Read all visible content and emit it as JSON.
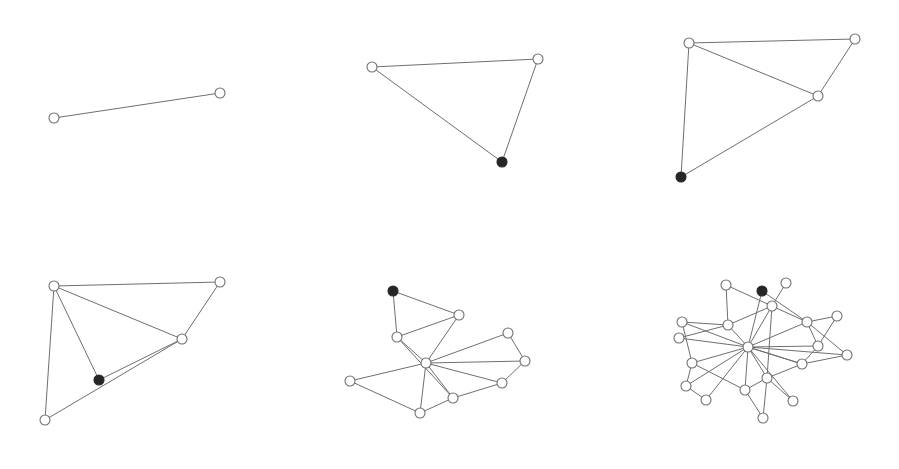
{
  "figure": {
    "node_radius": 5,
    "colors": {
      "edge": "#6f6f6f",
      "open_node_stroke": "#707070",
      "open_node_fill": "#ffffff",
      "filled_node": "#262626"
    }
  },
  "panels": [
    {
      "id": 1,
      "nodes": [
        {
          "x": 54,
          "y": 118,
          "filled": false
        },
        {
          "x": 220,
          "y": 93,
          "filled": false
        }
      ],
      "edges": [
        [
          0,
          1
        ]
      ]
    },
    {
      "id": 2,
      "nodes": [
        {
          "x": 372,
          "y": 67,
          "filled": false
        },
        {
          "x": 538,
          "y": 59,
          "filled": false
        },
        {
          "x": 502,
          "y": 162,
          "filled": true
        }
      ],
      "edges": [
        [
          0,
          1
        ],
        [
          0,
          2
        ],
        [
          1,
          2
        ]
      ]
    },
    {
      "id": 3,
      "nodes": [
        {
          "x": 689,
          "y": 43,
          "filled": false
        },
        {
          "x": 855,
          "y": 39,
          "filled": false
        },
        {
          "x": 818,
          "y": 96,
          "filled": false
        },
        {
          "x": 681,
          "y": 177,
          "filled": true
        }
      ],
      "edges": [
        [
          0,
          1
        ],
        [
          0,
          2
        ],
        [
          1,
          2
        ],
        [
          0,
          3
        ],
        [
          2,
          3
        ]
      ]
    },
    {
      "id": 4,
      "nodes": [
        {
          "x": 54,
          "y": 286,
          "filled": false
        },
        {
          "x": 220,
          "y": 282,
          "filled": false
        },
        {
          "x": 182,
          "y": 339,
          "filled": false
        },
        {
          "x": 99,
          "y": 380,
          "filled": true
        },
        {
          "x": 45,
          "y": 420,
          "filled": false
        }
      ],
      "edges": [
        [
          0,
          1
        ],
        [
          0,
          2
        ],
        [
          1,
          2
        ],
        [
          0,
          3
        ],
        [
          2,
          3
        ],
        [
          0,
          4
        ],
        [
          2,
          4
        ]
      ]
    },
    {
      "id": 5,
      "nodes": [
        {
          "x": 393,
          "y": 291,
          "filled": true
        },
        {
          "x": 459,
          "y": 315,
          "filled": false
        },
        {
          "x": 397,
          "y": 337,
          "filled": false
        },
        {
          "x": 426,
          "y": 363,
          "filled": false
        },
        {
          "x": 508,
          "y": 333,
          "filled": false
        },
        {
          "x": 525,
          "y": 361,
          "filled": false
        },
        {
          "x": 502,
          "y": 383,
          "filled": false
        },
        {
          "x": 453,
          "y": 398,
          "filled": false
        },
        {
          "x": 420,
          "y": 413,
          "filled": false
        },
        {
          "x": 350,
          "y": 381,
          "filled": false
        }
      ],
      "edges": [
        [
          0,
          1
        ],
        [
          0,
          2
        ],
        [
          1,
          2
        ],
        [
          1,
          3
        ],
        [
          2,
          3
        ],
        [
          2,
          7
        ],
        [
          3,
          4
        ],
        [
          3,
          5
        ],
        [
          3,
          6
        ],
        [
          3,
          7
        ],
        [
          3,
          8
        ],
        [
          3,
          9
        ],
        [
          4,
          5
        ],
        [
          5,
          6
        ],
        [
          6,
          7
        ],
        [
          7,
          8
        ],
        [
          8,
          9
        ]
      ]
    },
    {
      "id": 6,
      "nodes": [
        {
          "x": 762,
          "y": 291,
          "filled": true
        },
        {
          "x": 726,
          "y": 285,
          "filled": false
        },
        {
          "x": 786,
          "y": 283,
          "filled": false
        },
        {
          "x": 772,
          "y": 306,
          "filled": false
        },
        {
          "x": 807,
          "y": 322,
          "filled": false
        },
        {
          "x": 837,
          "y": 316,
          "filled": false
        },
        {
          "x": 728,
          "y": 325,
          "filled": false
        },
        {
          "x": 682,
          "y": 322,
          "filled": false
        },
        {
          "x": 679,
          "y": 338,
          "filled": false
        },
        {
          "x": 748,
          "y": 347,
          "filled": false
        },
        {
          "x": 818,
          "y": 346,
          "filled": false
        },
        {
          "x": 847,
          "y": 355,
          "filled": false
        },
        {
          "x": 802,
          "y": 364,
          "filled": false
        },
        {
          "x": 692,
          "y": 363,
          "filled": false
        },
        {
          "x": 767,
          "y": 378,
          "filled": false
        },
        {
          "x": 686,
          "y": 386,
          "filled": false
        },
        {
          "x": 745,
          "y": 390,
          "filled": false
        },
        {
          "x": 706,
          "y": 400,
          "filled": false
        },
        {
          "x": 793,
          "y": 401,
          "filled": false
        },
        {
          "x": 763,
          "y": 418,
          "filled": false
        }
      ],
      "edges": [
        [
          1,
          3
        ],
        [
          1,
          6
        ],
        [
          0,
          9
        ],
        [
          2,
          3
        ],
        [
          0,
          4
        ],
        [
          3,
          9
        ],
        [
          3,
          6
        ],
        [
          3,
          4
        ],
        [
          4,
          5
        ],
        [
          4,
          10
        ],
        [
          4,
          11
        ],
        [
          5,
          10
        ],
        [
          6,
          7
        ],
        [
          6,
          8
        ],
        [
          6,
          9
        ],
        [
          7,
          9
        ],
        [
          7,
          13
        ],
        [
          8,
          9
        ],
        [
          9,
          4
        ],
        [
          9,
          10
        ],
        [
          9,
          11
        ],
        [
          9,
          12
        ],
        [
          9,
          13
        ],
        [
          9,
          14
        ],
        [
          9,
          15
        ],
        [
          9,
          16
        ],
        [
          9,
          17
        ],
        [
          9,
          18
        ],
        [
          10,
          12
        ],
        [
          11,
          12
        ],
        [
          12,
          14
        ],
        [
          13,
          15
        ],
        [
          13,
          16
        ],
        [
          15,
          17
        ],
        [
          14,
          16
        ],
        [
          14,
          19
        ],
        [
          16,
          19
        ],
        [
          14,
          18
        ],
        [
          3,
          14
        ],
        [
          12,
          9
        ]
      ]
    }
  ]
}
